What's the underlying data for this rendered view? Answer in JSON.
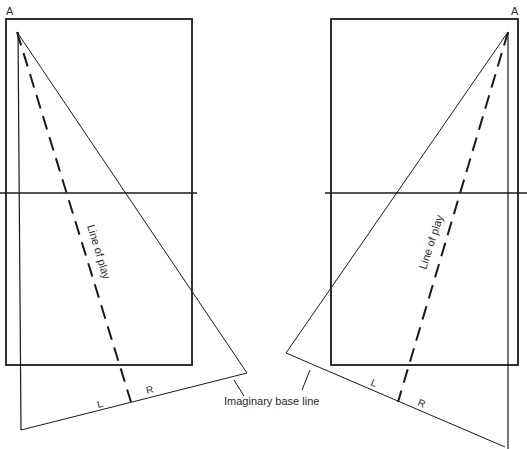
{
  "diagram": {
    "type": "court line-of-play diagram",
    "left_panel": {
      "apex_label": "A",
      "line_label": "Line of play",
      "left_label": "L",
      "right_label": "R"
    },
    "right_panel": {
      "apex_label": "A",
      "line_label": "Line of play",
      "left_label": "L",
      "right_label": "R"
    },
    "callout": "Imaginary base line",
    "colors": {
      "line": "#1a1a1a",
      "background": "#ffffff"
    }
  }
}
